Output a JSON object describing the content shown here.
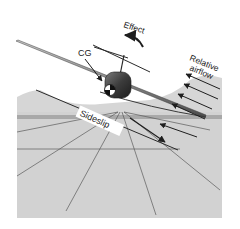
{
  "diagram": {
    "type": "aircraft-sideslip-front-view",
    "labels": {
      "cg": "CG",
      "effect": "Effect",
      "relative_airflow_line1": "Relative",
      "relative_airflow_line2": "airflow",
      "sideslip": "Sideslip"
    },
    "colors": {
      "background": "#ffffff",
      "ground": "#d4d4d4",
      "ground_far": "#cfcfcf",
      "lines": "#555555",
      "arrows": "#1e1e1e",
      "fuselage": "#3a3a3a",
      "wing": "#8a8a8a",
      "sideslip_box": "#ffffff"
    },
    "relative_airflow_arrow_count": 4
  }
}
